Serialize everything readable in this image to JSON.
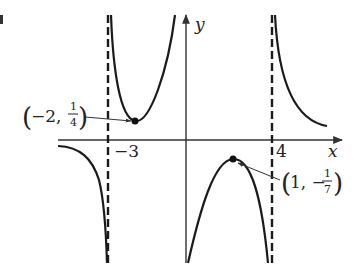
{
  "figure": {
    "type": "function-graph",
    "axes": {
      "x_label": "x",
      "y_label": "y"
    },
    "tick_labels": {
      "left_asymptote": "−3",
      "right_asymptote": "4"
    },
    "vertical_asymptotes": [
      -3,
      4
    ],
    "horizontal_asymptote": 0,
    "points": [
      {
        "name": "local-minimum",
        "x": -2,
        "y_num": "1",
        "y_den": "4",
        "label_x": "−2,",
        "label_y_num": "1",
        "label_y_den": "4",
        "open": "(",
        "close": ")"
      },
      {
        "name": "local-maximum",
        "x": 1,
        "y_sign": "−",
        "y_num": "1",
        "y_den": "7",
        "label_x": "1, −",
        "label_y_num": "1",
        "label_y_den": "7",
        "open": "(",
        "close": ")"
      }
    ],
    "colors": {
      "curve": "#1a1a1a",
      "axis": "#333333",
      "asymptote": "#1a1a1a"
    }
  }
}
